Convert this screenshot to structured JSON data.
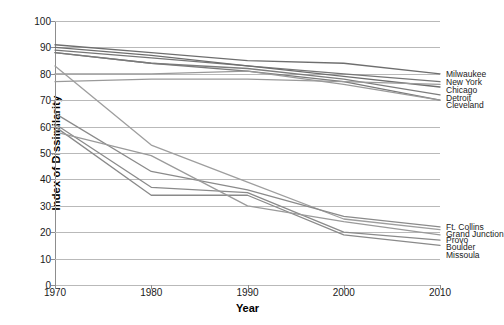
{
  "chart_data": {
    "type": "line",
    "title": "",
    "xlabel": "Year",
    "ylabel": "Index of Dissimilarity",
    "x": [
      1970,
      1980,
      1990,
      2000,
      2010
    ],
    "xlim": [
      1970,
      2010
    ],
    "ylim": [
      0,
      100
    ],
    "xticks": [
      "1970",
      "1980",
      "1990",
      "2000",
      "2010"
    ],
    "yticks": [
      "0",
      "10",
      "20",
      "30",
      "40",
      "50",
      "60",
      "70",
      "80",
      "90",
      "100"
    ],
    "grid": true,
    "legend_position": "right-inline-labels",
    "series": [
      {
        "name": "Milwaukee",
        "values": [
          91,
          88,
          85,
          84,
          80
        ],
        "color": "#6e6e6e"
      },
      {
        "name": "New York",
        "values": [
          89,
          86,
          83,
          80,
          77
        ],
        "color": "#767676"
      },
      {
        "name": "Chicago",
        "values": [
          90,
          87,
          83,
          79,
          75
        ],
        "color": "#6e6e6e"
      },
      {
        "name": "Detroit",
        "values": [
          88,
          84,
          82,
          78,
          72
        ],
        "color": "#7d7d7d"
      },
      {
        "name": "Cleveland",
        "values": [
          88,
          84,
          81,
          77,
          70
        ],
        "color": "#7a7a7a"
      },
      {
        "name": "Ft. Collins",
        "values": [
          80,
          80,
          81,
          76,
          70
        ],
        "color": "#9a9a9a"
      },
      {
        "name": "Grand Junction",
        "values": [
          77,
          78,
          78,
          77,
          76
        ],
        "color": "#9a9a9a"
      },
      {
        "name": "Provo",
        "values": [
          83,
          53,
          39,
          25,
          21
        ],
        "color": "#9e9e9e"
      },
      {
        "name": "Boulder",
        "values": [
          65,
          43,
          36,
          26,
          22
        ],
        "color": "#8a8a8a"
      },
      {
        "name": "Missoula",
        "values": [
          61,
          37,
          35,
          20,
          17
        ],
        "color": "#8a8a8a"
      },
      {
        "name": "Series11",
        "values": [
          60,
          34,
          34,
          19,
          15
        ],
        "color": "#8a8a8a"
      },
      {
        "name": "Series12",
        "values": [
          58,
          49,
          30,
          24,
          19
        ],
        "color": "#9a9a9a"
      }
    ]
  },
  "labels_top": [
    {
      "text": "Milwaukee",
      "value": 80
    },
    {
      "text": "New York",
      "value": 77
    },
    {
      "text": "Chicago",
      "value": 74
    },
    {
      "text": "Detroit",
      "value": 71
    },
    {
      "text": "Cleveland",
      "value": 68
    }
  ],
  "labels_bottom": [
    {
      "text": "Ft. Collins",
      "value": 22
    },
    {
      "text": "Grand Junction",
      "value": 19.5
    },
    {
      "text": "Provo",
      "value": 17
    },
    {
      "text": "Boulder",
      "value": 14.5
    },
    {
      "text": "Missoula",
      "value": 11.5
    }
  ],
  "axes": {
    "ylabel": "Index of Dissimilarity",
    "xlabel": "Year"
  },
  "colors": {
    "grid": "#b9b9b9",
    "axis": "#8d8d8d",
    "text": "#1a1a1a",
    "line_dark": "#6e6e6e",
    "line_light": "#9a9a9a"
  }
}
